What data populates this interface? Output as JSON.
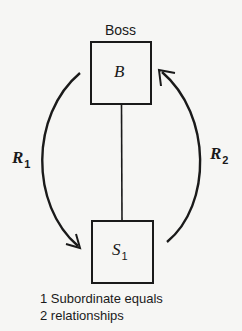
{
  "diagram": {
    "boss_title": "Boss",
    "boss_box": {
      "letter": "B"
    },
    "subordinate_box": {
      "letter": "S",
      "subscript": "1"
    },
    "relations": [
      {
        "letter": "R",
        "subscript": "1",
        "direction": "boss-to-subordinate"
      },
      {
        "letter": "R",
        "subscript": "2",
        "direction": "subordinate-to-boss"
      }
    ],
    "caption": {
      "line1": "1 Subordinate equals",
      "line2": "2 relationships"
    },
    "colors": {
      "ink": "#1a1a1a",
      "background": "#f6f6f4"
    }
  }
}
